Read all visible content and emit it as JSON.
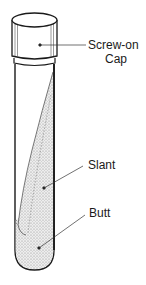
{
  "diagram": {
    "labels": {
      "cap_line1": "Screw-on",
      "cap_line2": "Cap",
      "slant": "Slant",
      "butt": "Butt"
    },
    "colors": {
      "outline": "#1a1a1a",
      "stipple": "#c8c8c8",
      "background": "#ffffff"
    }
  }
}
